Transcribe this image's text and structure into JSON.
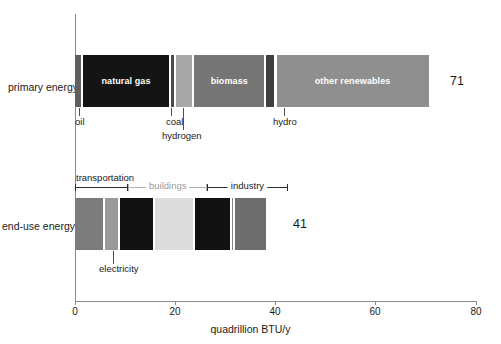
{
  "chart_data": {
    "type": "bar",
    "orientation": "horizontal",
    "title": "",
    "xlabel": "quadrillion BTU/y",
    "ylabel": "",
    "xlim": [
      0,
      80
    ],
    "xticks": [
      0,
      20,
      40,
      60,
      80
    ],
    "xtick_labels": [
      "0",
      "20",
      "40",
      "60",
      "80"
    ],
    "grid": false,
    "legend": "none",
    "categories": [
      "primary energy",
      "end-use energy"
    ],
    "totals": [
      71,
      41
    ],
    "stacked_series": {
      "primary energy": [
        {
          "name": "oil",
          "value": 1.6,
          "color": "#5f5f5f",
          "labeled_inside": false
        },
        {
          "name": "natural gas",
          "value": 17.6,
          "color": "#141414",
          "labeled_inside": true
        },
        {
          "name": "coal",
          "value": 1.0,
          "color": "#4a4a4a",
          "labeled_inside": false
        },
        {
          "name": "hydrogen",
          "value": 3.6,
          "color": "#a8a8a8",
          "labeled_inside": false
        },
        {
          "name": "biomass",
          "value": 14.4,
          "color": "#757575",
          "labeled_inside": true
        },
        {
          "name": "hydro",
          "value": 2.0,
          "color": "#3f3f3f",
          "labeled_inside": false
        },
        {
          "name": "other renewables",
          "value": 30.8,
          "color": "#8f8f8f",
          "labeled_inside": true
        }
      ],
      "end-use energy": [
        {
          "name": "segment-1",
          "value": 6.0,
          "color": "#7c7c7c"
        },
        {
          "name": "electricity",
          "value": 3.0,
          "color": "#9a9a9a"
        },
        {
          "name": "segment-3",
          "value": 7.0,
          "color": "#111111"
        },
        {
          "name": "segment-4",
          "value": 8.0,
          "color": "#dcdcdc"
        },
        {
          "name": "segment-5",
          "value": 7.4,
          "color": "#111111"
        },
        {
          "name": "segment-6",
          "value": 0.6,
          "color": "#8a8a8a"
        },
        {
          "name": "segment-7",
          "value": 6.6,
          "color": "#6e6e6e"
        }
      ]
    },
    "callouts": [
      {
        "text": "oil",
        "target_value": 0.8
      },
      {
        "text": "coal",
        "target_value": 19.2
      },
      {
        "text": "hydrogen",
        "target_value": 21.5
      },
      {
        "text": "hydro",
        "target_value": 41.5
      },
      {
        "text": "electricity",
        "target_value": 7.5
      }
    ],
    "sector_brackets": [
      {
        "label": "transportation",
        "start": 0.0,
        "end": 10.6,
        "style": "dark"
      },
      {
        "label": "buildings",
        "start": 10.6,
        "end": 26.4,
        "style": "light"
      },
      {
        "label": "industry",
        "start": 26.4,
        "end": 42.4,
        "style": "dark"
      }
    ]
  },
  "labels": {
    "primary_energy": "primary energy",
    "end_use_energy": "end-use energy",
    "primary_total": "71",
    "end_use_total": "41",
    "axis_title": "quadrillion BTU/y",
    "natural_gas": "natural gas",
    "biomass": "biomass",
    "other_renewables": "other renewables",
    "oil": "oil",
    "coal": "coal",
    "hydrogen": "hydrogen",
    "hydro": "hydro",
    "electricity": "electricity",
    "transportation": "transportation",
    "buildings": "buildings",
    "industry": "industry",
    "tick_0": "0",
    "tick_20": "20",
    "tick_40": "40",
    "tick_60": "60",
    "tick_80": "80"
  }
}
